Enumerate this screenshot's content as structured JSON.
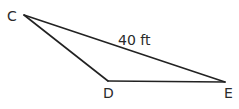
{
  "figure": {
    "type": "triangle",
    "vertices": [
      {
        "id": "C",
        "label": "C",
        "x": 24,
        "y": 15,
        "label_x": 7,
        "label_y": 21
      },
      {
        "id": "D",
        "label": "D",
        "x": 108,
        "y": 81,
        "label_x": 103,
        "label_y": 98
      },
      {
        "id": "E",
        "label": "E",
        "x": 225,
        "y": 82,
        "label_x": 224,
        "label_y": 98
      }
    ],
    "edges": [
      {
        "from": "C",
        "to": "E",
        "label": "40 ft"
      },
      {
        "from": "C",
        "to": "D",
        "label": ""
      },
      {
        "from": "D",
        "to": "E",
        "label": ""
      }
    ],
    "measurement_label": "40 ft",
    "line_color": "#222222",
    "text_color": "#2a2a2a"
  }
}
